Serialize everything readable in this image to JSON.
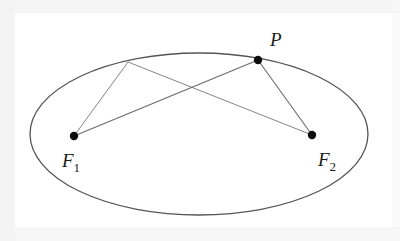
{
  "figure": {
    "kind": "geometry-diagram",
    "canvas": {
      "width": 400,
      "height": 241
    },
    "background_color": "#ffffff"
  },
  "chart_data": {
    "type": "scatter",
    "title": "",
    "xlabel": "",
    "ylabel": "",
    "grid": false,
    "legend": null,
    "ellipse": {
      "center_x": 199,
      "center_y": 134,
      "radius_x": 169,
      "radius_y": 81,
      "stroke_color": "#555555",
      "stroke_width": 1.3,
      "fill": "none"
    },
    "points": [
      {
        "id": "P",
        "label": "P",
        "x": 258,
        "y": 60,
        "on_ellipse": true,
        "marked": true,
        "radius": 4.2
      },
      {
        "id": "Q",
        "label": "",
        "x": 128,
        "y": 62,
        "on_ellipse": true,
        "marked": false,
        "radius": 0
      },
      {
        "id": "F1",
        "label": "F",
        "sub": "1",
        "x": 74,
        "y": 136,
        "on_ellipse": false,
        "marked": true,
        "radius": 4.2
      },
      {
        "id": "F2",
        "label": "F",
        "sub": "2",
        "x": 312,
        "y": 135,
        "on_ellipse": false,
        "marked": true,
        "radius": 4.2
      }
    ],
    "segments": [
      {
        "id": "seg-P-F1",
        "from": "P",
        "to": "F1",
        "x1": 258,
        "y1": 60,
        "x2": 74,
        "y2": 136,
        "stroke_color": "#6b6b6b",
        "stroke_width": 1.1
      },
      {
        "id": "seg-P-F2",
        "from": "P",
        "to": "F2",
        "x1": 258,
        "y1": 60,
        "x2": 312,
        "y2": 135,
        "stroke_color": "#6b6b6b",
        "stroke_width": 1.1
      },
      {
        "id": "seg-Q-F1",
        "from": "Q",
        "to": "F1",
        "x1": 128,
        "y1": 62,
        "x2": 74,
        "y2": 136,
        "stroke_color": "#858585",
        "stroke_width": 1.0
      },
      {
        "id": "seg-Q-F2",
        "from": "Q",
        "to": "F2",
        "x1": 128,
        "y1": 62,
        "x2": 312,
        "y2": 135,
        "stroke_color": "#858585",
        "stroke_width": 1.0
      }
    ],
    "crossing_point": {
      "x": 198,
      "y": 92
    }
  },
  "labels": {
    "point_p": {
      "text": "P",
      "x": 270,
      "y": 46
    },
    "focus_1": {
      "text": "F",
      "sub": "1",
      "x": 62,
      "y": 167
    },
    "focus_2": {
      "text": "F",
      "sub": "2",
      "x": 318,
      "y": 166
    }
  },
  "colors": {
    "ink": "#1a1a1a",
    "ellipse_stroke": "#555555",
    "segment_stroke": "#6b6b6b",
    "segment_stroke_light": "#858585",
    "paper": "#ffffff",
    "scan_margin": "#f2f2f2"
  }
}
